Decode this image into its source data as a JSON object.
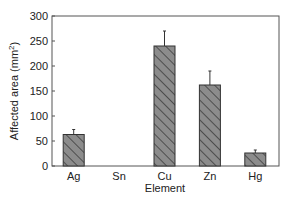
{
  "chart_data": {
    "type": "bar",
    "title": "",
    "xlabel": "Element",
    "ylabel": "Affected area (mm²)",
    "ylabel_parts": {
      "main": "Affected area (mm",
      "sup": "2",
      "end": ")"
    },
    "categories": [
      "Ag",
      "Sn",
      "Cu",
      "Zn",
      "Hg"
    ],
    "values": [
      63,
      0,
      240,
      162,
      26
    ],
    "errors": [
      10,
      0,
      30,
      28,
      6
    ],
    "ylim": [
      0,
      300
    ],
    "yticks": [
      0,
      50,
      100,
      150,
      200,
      250,
      300
    ],
    "grid": false,
    "legend": null,
    "bar_fill": "#8c8c8c",
    "bar_hatch": "diagonal",
    "bar_stroke": "#333333"
  }
}
